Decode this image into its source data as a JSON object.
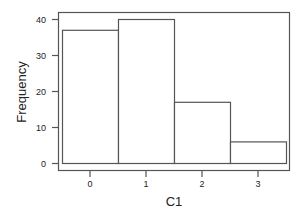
{
  "chart_data": {
    "type": "bar",
    "title": "",
    "xlabel": "C1",
    "ylabel": "Frequency",
    "categories": [
      "0",
      "1",
      "2",
      "3"
    ],
    "values": [
      37,
      40,
      17,
      6
    ],
    "ylim": [
      0,
      42
    ],
    "yticks": [
      0,
      10,
      20,
      30,
      40
    ],
    "grid": false,
    "legend": null,
    "bar_fill": "#ffffff",
    "bar_edge": "#555555"
  }
}
